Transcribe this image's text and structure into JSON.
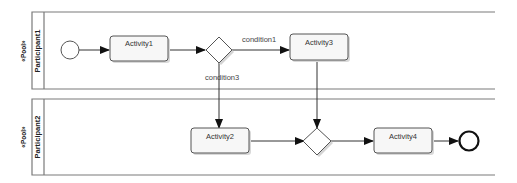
{
  "diagram": {
    "type": "BPMN collaboration",
    "pools": [
      {
        "stereotype": "«Pool»",
        "name": "Participant1",
        "elements": {
          "start_event": "start",
          "activity1": "Activity1",
          "gateway": "exclusive gateway",
          "activity3": "Activity3"
        }
      },
      {
        "stereotype": "«Pool»",
        "name": "Participant2",
        "elements": {
          "activity2": "Activity2",
          "gateway": "merge gateway",
          "activity4": "Activity4",
          "end_event": "end"
        }
      }
    ],
    "flows": [
      {
        "from": "start",
        "to": "Activity1",
        "label": ""
      },
      {
        "from": "Activity1",
        "to": "gateway1",
        "label": ""
      },
      {
        "from": "gateway1",
        "to": "Activity3",
        "label": "condition1"
      },
      {
        "from": "gateway1",
        "to": "Activity2",
        "label": "condition3"
      },
      {
        "from": "Activity3",
        "to": "gateway2",
        "label": ""
      },
      {
        "from": "Activity2",
        "to": "gateway2",
        "label": ""
      },
      {
        "from": "gateway2",
        "to": "Activity4",
        "label": ""
      },
      {
        "from": "Activity4",
        "to": "end",
        "label": ""
      }
    ],
    "labels": {
      "activity1": "Activity1",
      "activity2": "Activity2",
      "activity3": "Activity3",
      "activity4": "Activity4",
      "condition1": "condition1",
      "condition3": "condition3",
      "pool1_stereotype": "«Pool»",
      "pool1_name": "Participant1",
      "pool2_stereotype": "«Pool»",
      "pool2_name": "Participant2"
    }
  }
}
